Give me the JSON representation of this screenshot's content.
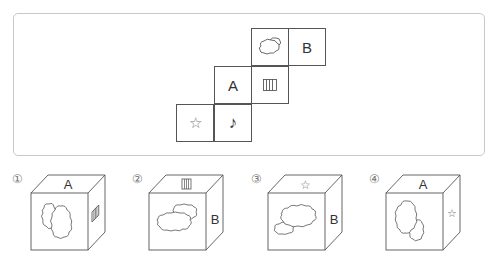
{
  "net": {
    "cells": [
      {
        "id": "cloud",
        "symbol": "cloud-icon",
        "label": ""
      },
      {
        "id": "b",
        "symbol": "",
        "label": "B"
      },
      {
        "id": "a",
        "symbol": "",
        "label": "A"
      },
      {
        "id": "stripes",
        "symbol": "stripes-icon",
        "label": ""
      },
      {
        "id": "star",
        "symbol": "star-icon",
        "label": "☆"
      },
      {
        "id": "note",
        "symbol": "note-icon",
        "label": "♪"
      }
    ]
  },
  "options": [
    {
      "number": "①",
      "top": "A",
      "front": "cloud",
      "right": "stripes"
    },
    {
      "number": "②",
      "top": "stripes",
      "front": "cloud",
      "right": "B"
    },
    {
      "number": "③",
      "top": "☆",
      "front": "cloud",
      "right": "B"
    },
    {
      "number": "④",
      "top": "A",
      "front": "cloud",
      "right": "☆"
    }
  ],
  "colors": {
    "line": "#555555",
    "frame": "#c8c8c8",
    "text": "#333333"
  }
}
